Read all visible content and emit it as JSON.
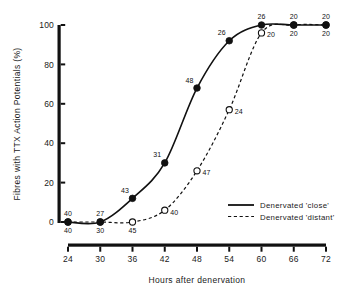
{
  "chart_data": {
    "type": "line",
    "title": "",
    "xlabel": "Hours after denervation",
    "ylabel": "Fibres with TTX Action Potentials (%)",
    "x": [
      24,
      30,
      36,
      42,
      48,
      54,
      60,
      66,
      72
    ],
    "xlim": [
      24,
      72
    ],
    "ylim": [
      0,
      100
    ],
    "xticks": [
      "24",
      "30",
      "36",
      "42",
      "48",
      "54",
      "60",
      "66",
      "72"
    ],
    "yticks": [
      "0",
      "20",
      "40",
      "60",
      "80",
      "100"
    ],
    "grid": false,
    "legend_position": "lower right",
    "series": [
      {
        "name": "Denervated 'close'",
        "marker": "filled-circle",
        "line": "solid",
        "values": [
          0,
          0,
          12,
          30,
          68,
          92,
          100,
          100,
          100
        ],
        "point_labels": [
          "40",
          "27",
          "43",
          "31",
          "48",
          "26",
          "26",
          "20",
          "20"
        ],
        "label_position": "above"
      },
      {
        "name": "Denervated 'distant'",
        "marker": "open-circle",
        "line": "dashed",
        "values": [
          0,
          0,
          0,
          6,
          26,
          57,
          96,
          100,
          100
        ],
        "point_labels": [
          "40",
          "30",
          "45",
          "40",
          "47",
          "24",
          "20",
          "20",
          "20"
        ],
        "label_position": "below"
      }
    ]
  },
  "legend": {
    "items": [
      {
        "label": "Denervated 'close'",
        "style": "solid"
      },
      {
        "label": "Denervated 'distant'",
        "style": "dashed"
      }
    ]
  },
  "colors": {
    "ink": "#111111",
    "background": "#ffffff"
  }
}
